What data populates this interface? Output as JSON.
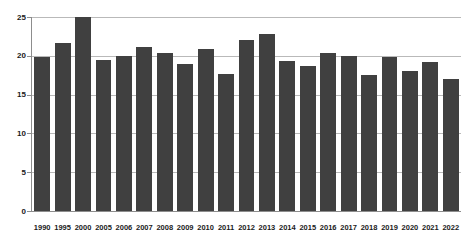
{
  "chart_data": {
    "type": "bar",
    "title": "",
    "subtitle": "",
    "xlabel": "",
    "ylabel": "",
    "categories": [
      "1990",
      "1995",
      "2000",
      "2005",
      "2006",
      "2007",
      "2008",
      "2009",
      "2010",
      "2011",
      "2012",
      "2013",
      "2014",
      "2015",
      "2016",
      "2017",
      "2018",
      "2019",
      "2020",
      "2021",
      "2022"
    ],
    "values": [
      19.8,
      21.7,
      25.0,
      19.5,
      20.0,
      21.1,
      20.4,
      19.0,
      20.9,
      17.7,
      22.1,
      22.8,
      19.3,
      18.7,
      20.3,
      20.0,
      17.5,
      19.9,
      18.0,
      19.2,
      17.0
    ],
    "ylim": [
      0,
      25
    ],
    "yticks": [
      0,
      5,
      10,
      15,
      20,
      25
    ],
    "ytick_labels": [
      "0",
      "5",
      "10",
      "15",
      "20",
      "25"
    ],
    "grid": true,
    "grid_axis": "y",
    "legend": false,
    "legend_position": "none",
    "series": [
      {
        "name": "",
        "color": "#404040",
        "values": [
          19.8,
          21.7,
          25.0,
          19.5,
          20.0,
          21.1,
          20.4,
          19.0,
          20.9,
          17.7,
          22.1,
          22.8,
          19.3,
          18.7,
          20.3,
          20.0,
          17.5,
          19.9,
          18.0,
          19.2,
          17.0
        ]
      }
    ],
    "colors": {
      "bar": "#404040",
      "gridline": "#b9b9b9",
      "axis": "#8d8d8d",
      "text": "#1a1a1a",
      "background": "#ffffff"
    },
    "annotations": []
  }
}
